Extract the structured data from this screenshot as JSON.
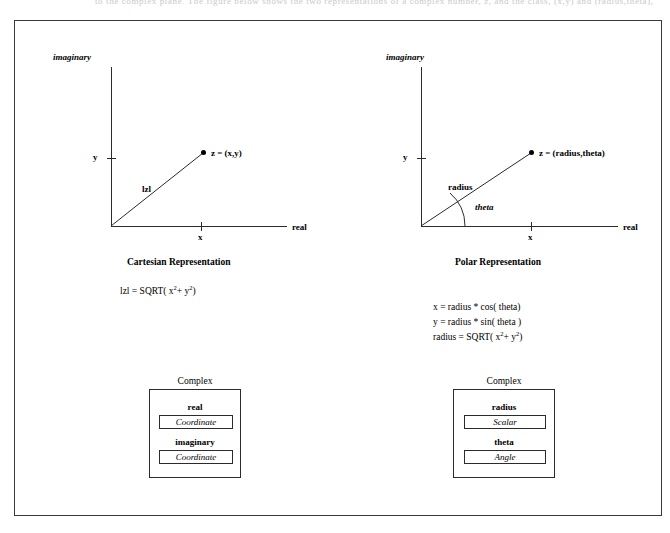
{
  "page": {
    "bleed_text": "to the complex plane. The figure below shows the two representations of a complex number, z, and the class, (x,y) and (radius,theta), figure 9"
  },
  "figure": {
    "cartesian": {
      "axis_labels": {
        "vertical": "imaginary",
        "horizontal": "real"
      },
      "tick_labels": {
        "y": "y",
        "x": "x"
      },
      "point_label": "z = (x,y)",
      "vector_label": "lzl",
      "caption": "Cartesian Representation",
      "formulas": [
        "lzl = SQRT( x 2+ y 2)"
      ],
      "formula_parts": {
        "lhs": "lzl = SQRT( x",
        "exp1": "2",
        "mid": "+  y",
        "exp2": "2",
        "rhs": ")"
      },
      "class_box": {
        "title": "Complex",
        "attributes": [
          {
            "name": "real",
            "type": "Coordinate"
          },
          {
            "name": "imaginary",
            "type": "Coordinate"
          }
        ]
      }
    },
    "polar": {
      "axis_labels": {
        "vertical": "imaginary",
        "horizontal": "real"
      },
      "tick_labels": {
        "y": "y",
        "x": "x"
      },
      "point_label": "z = (radius,theta)",
      "vector_label": "radius",
      "angle_label": "theta",
      "caption": "Polar Representation",
      "formulas": [
        "x = radius * cos( theta)",
        "y = radius * sin( theta )",
        "radius = SQRT(  x 2+  y 2)"
      ],
      "formula_parts": {
        "line1": "x = radius * cos( theta)",
        "line2": "y = radius * sin( theta )",
        "line3_lhs": "radius = SQRT(  x",
        "line3_exp1": "2",
        "line3_mid": "+  y",
        "line3_exp2": "2",
        "line3_rhs": ")"
      },
      "class_box": {
        "title": "Complex",
        "attributes": [
          {
            "name": "radius",
            "type": "Scalar"
          },
          {
            "name": "theta",
            "type": "Angle"
          }
        ]
      }
    }
  },
  "colors": {
    "ink": "#000000",
    "rule": "#2b2b2b",
    "frame": "#3a3a3a",
    "bleed": "#c9c9c9"
  }
}
